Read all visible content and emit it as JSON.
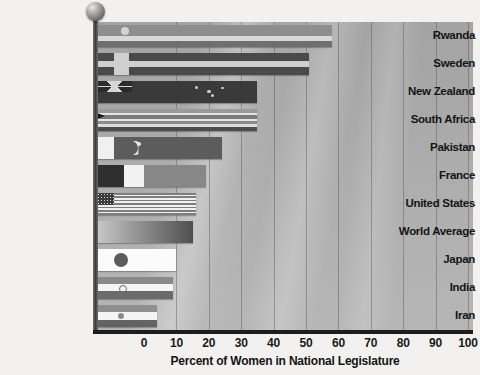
{
  "chart_data": {
    "type": "bar",
    "orientation": "horizontal",
    "title": "",
    "xlabel": "Percent of Women in National Legislature",
    "ylabel": "",
    "xlim": [
      0,
      100
    ],
    "xticks": [
      0,
      10,
      20,
      30,
      40,
      50,
      60,
      70,
      80,
      90,
      100
    ],
    "grid": true,
    "legend": false,
    "categories": [
      "Rwanda",
      "Sweden",
      "New Zealand",
      "South Africa",
      "Pakistan",
      "France",
      "United States",
      "World Average",
      "Japan",
      "India",
      "Iran"
    ],
    "values": [
      58,
      51,
      35,
      35,
      24,
      19,
      16,
      15,
      10,
      9,
      4
    ],
    "bar_fill": "national-flag-image",
    "background": "cloudy-sky-grayscale",
    "annotations": []
  },
  "axis": {
    "tick_labels": [
      "0",
      "10",
      "20",
      "30",
      "40",
      "50",
      "60",
      "70",
      "80",
      "90",
      "100"
    ],
    "x_title": "Percent of Women in National Legislature"
  },
  "bars": [
    {
      "label": "Rwanda",
      "value": 58,
      "flag": "rwanda-flag"
    },
    {
      "label": "Sweden",
      "value": 51,
      "flag": "sweden-flag"
    },
    {
      "label": "New Zealand",
      "value": 35,
      "flag": "new-zealand-flag"
    },
    {
      "label": "South Africa",
      "value": 35,
      "flag": "south-africa-flag"
    },
    {
      "label": "Pakistan",
      "value": 24,
      "flag": "pakistan-flag"
    },
    {
      "label": "France",
      "value": 19,
      "flag": "france-flag"
    },
    {
      "label": "United States",
      "value": 16,
      "flag": "united-states-flag"
    },
    {
      "label": "World Average",
      "value": 15,
      "flag": "world-average-gradient"
    },
    {
      "label": "Japan",
      "value": 10,
      "flag": "japan-flag"
    },
    {
      "label": "India",
      "value": 9,
      "flag": "india-flag"
    },
    {
      "label": "Iran",
      "value": 4,
      "flag": "iran-flag"
    }
  ],
  "colors": {
    "background": "#f2f1ef",
    "plot_background": "#acacac",
    "axis": "#1d1d1d",
    "gridline": "#505050",
    "text": "#141414"
  }
}
